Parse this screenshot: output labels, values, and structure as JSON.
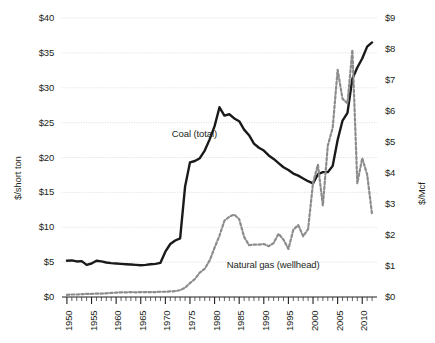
{
  "chart_data": {
    "type": "line",
    "title": "",
    "xlabel": "",
    "ylabel": "$/short ton",
    "y2label": "$/Mcf",
    "xlim": [
      1949,
      2013
    ],
    "ylim": [
      0,
      40
    ],
    "y2lim": [
      0,
      9
    ],
    "grid": true,
    "legend_position": "inline-annotations",
    "x_tick_labels": [
      "1950",
      "1955",
      "1960",
      "1965",
      "1970",
      "1975",
      "1980",
      "1985",
      "1990",
      "1995",
      "2000",
      "2005",
      "2010"
    ],
    "x_tick_values": [
      1950,
      1955,
      1960,
      1965,
      1970,
      1975,
      1980,
      1985,
      1990,
      1995,
      2000,
      2005,
      2010
    ],
    "x_minor_tick_step": 1,
    "y_left_tick_labels": [
      "$0",
      "$5",
      "$10",
      "$15",
      "$20",
      "$25",
      "$30",
      "$35",
      "$40"
    ],
    "y_left_tick_values": [
      0,
      5,
      10,
      15,
      20,
      25,
      30,
      35,
      40
    ],
    "y_right_tick_labels": [
      "$0",
      "$1",
      "$2",
      "$3",
      "$4",
      "$5",
      "$6",
      "$7",
      "$8",
      "$9"
    ],
    "y_right_tick_values": [
      0,
      1,
      2,
      3,
      4,
      5,
      6,
      7,
      8,
      9
    ],
    "series": [
      {
        "name": "Coal (total)",
        "axis": "left",
        "style": "solid",
        "color": "#1a1a1a",
        "x": [
          1950,
          1951,
          1952,
          1953,
          1954,
          1955,
          1956,
          1957,
          1958,
          1959,
          1960,
          1961,
          1962,
          1963,
          1964,
          1965,
          1966,
          1967,
          1968,
          1969,
          1970,
          1971,
          1972,
          1973,
          1974,
          1975,
          1976,
          1977,
          1978,
          1979,
          1980,
          1981,
          1982,
          1983,
          1984,
          1985,
          1986,
          1987,
          1988,
          1989,
          1990,
          1991,
          1992,
          1993,
          1994,
          1995,
          1996,
          1997,
          1998,
          1999,
          2000,
          2001,
          2002,
          2003,
          2004,
          2005,
          2006,
          2007,
          2008,
          2009,
          2010,
          2011,
          2012
        ],
        "y": [
          5.2,
          5.25,
          5.1,
          5.15,
          4.6,
          4.8,
          5.2,
          5.1,
          4.95,
          4.85,
          4.8,
          4.75,
          4.7,
          4.65,
          4.6,
          4.55,
          4.6,
          4.7,
          4.75,
          4.9,
          6.5,
          7.6,
          8.1,
          8.4,
          15.8,
          19.3,
          19.5,
          19.9,
          21.0,
          22.6,
          24.5,
          27.2,
          26.0,
          26.2,
          25.6,
          25.2,
          24.0,
          23.2,
          22.0,
          21.4,
          21.0,
          20.3,
          19.8,
          19.2,
          18.6,
          18.2,
          17.7,
          17.4,
          17.0,
          16.6,
          16.3,
          17.6,
          17.9,
          17.9,
          18.8,
          22.5,
          25.3,
          26.4,
          31.3,
          32.9,
          34.2,
          35.9,
          36.5
        ]
      },
      {
        "name": "Natural gas (wellhead)",
        "axis": "right",
        "style": "dashed",
        "color": "#8c8c8c",
        "x": [
          1950,
          1951,
          1952,
          1953,
          1954,
          1955,
          1956,
          1957,
          1958,
          1959,
          1960,
          1961,
          1962,
          1963,
          1964,
          1965,
          1966,
          1967,
          1968,
          1969,
          1970,
          1971,
          1972,
          1973,
          1974,
          1975,
          1976,
          1977,
          1978,
          1979,
          1980,
          1981,
          1982,
          1983,
          1984,
          1985,
          1986,
          1987,
          1988,
          1989,
          1990,
          1991,
          1992,
          1993,
          1994,
          1995,
          1996,
          1997,
          1998,
          1999,
          2000,
          2001,
          2002,
          2003,
          2004,
          2005,
          2006,
          2007,
          2008,
          2009,
          2010,
          2011,
          2012
        ],
        "y": [
          0.07,
          0.08,
          0.08,
          0.09,
          0.1,
          0.1,
          0.11,
          0.11,
          0.12,
          0.13,
          0.14,
          0.15,
          0.15,
          0.16,
          0.15,
          0.16,
          0.16,
          0.16,
          0.16,
          0.17,
          0.17,
          0.18,
          0.19,
          0.22,
          0.3,
          0.45,
          0.58,
          0.79,
          0.91,
          1.18,
          1.59,
          1.98,
          2.46,
          2.59,
          2.66,
          2.51,
          1.94,
          1.67,
          1.69,
          1.69,
          1.71,
          1.64,
          1.74,
          2.04,
          1.85,
          1.55,
          2.17,
          2.32,
          1.96,
          2.19,
          3.68,
          4.27,
          2.95,
          4.88,
          5.46,
          7.33,
          6.39,
          6.25,
          7.97,
          3.67,
          4.48,
          3.95,
          2.66
        ]
      }
    ],
    "annotations": [
      {
        "text": "Coal (total)",
        "x": 1977,
        "y": 23.4,
        "axis": "left"
      },
      {
        "text": "Natural gas (wellhead)",
        "x": 1991,
        "y": 4.6,
        "axis": "left"
      }
    ]
  }
}
